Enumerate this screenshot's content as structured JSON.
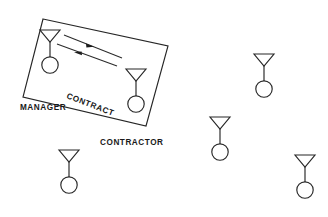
{
  "diagram": {
    "background_color": "#ffffff",
    "line_color": "#262626",
    "text_color": "#1a1a1a",
    "labels": {
      "manager": "MANAGER",
      "contract": "CONTRACT",
      "contractor": "CONTRACTOR"
    },
    "contract_boundary": {
      "shape": "parallelogram",
      "rotation_deg": 21,
      "points": "43,19 168,46 146,126 23,97"
    },
    "exchange_arrows": {
      "count": 2,
      "description": "two parallel lines with opposing mid-line arrowheads"
    },
    "figures": [
      {
        "name": "manager-figure",
        "role": "manager",
        "inside_contract": true,
        "x": 50,
        "y": 33
      },
      {
        "name": "contractor-figure",
        "role": "contractor",
        "inside_contract": true,
        "x": 136,
        "y": 72
      },
      {
        "name": "bystander-figure-1",
        "role": "unassigned",
        "inside_contract": false,
        "x": 69,
        "y": 152
      },
      {
        "name": "bystander-figure-2",
        "role": "unassigned",
        "inside_contract": false,
        "x": 264,
        "y": 56
      },
      {
        "name": "bystander-figure-3",
        "role": "unassigned",
        "inside_contract": false,
        "x": 220,
        "y": 119
      },
      {
        "name": "bystander-figure-4",
        "role": "unassigned",
        "inside_contract": false,
        "x": 305,
        "y": 157
      }
    ]
  }
}
